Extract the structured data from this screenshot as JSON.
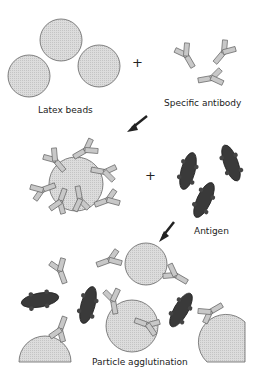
{
  "labels": {
    "latex_beads": "Latex beads",
    "specific_antibody": "Specific antibody",
    "antigen": "Antigen",
    "particle_agglutination": "Particle agglutination",
    "plus": "+"
  },
  "colors": {
    "bead_fill": "#d9d9d9",
    "antibody_fill": "#c8c8c8",
    "antigen_fill": "#3a3a3a",
    "outline": "#555555"
  }
}
